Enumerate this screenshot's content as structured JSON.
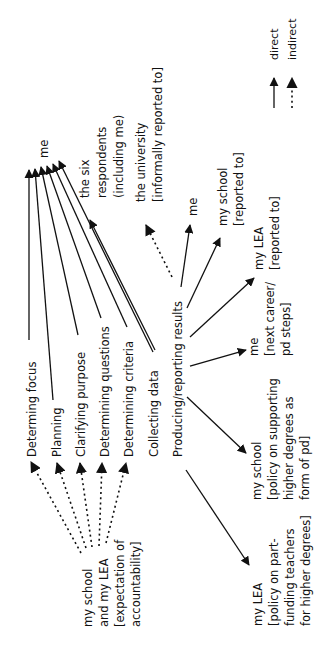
{
  "legend": {
    "direct": "direct",
    "indirect": "indirect"
  },
  "source": {
    "lines": [
      "my school",
      "and my LEA",
      "[expectation of",
      "accountability]"
    ]
  },
  "stages": [
    {
      "label": "Determing focus"
    },
    {
      "label": "Planning"
    },
    {
      "label": "Clarifying purpose"
    },
    {
      "label": "Determining questions"
    },
    {
      "label": "Determining criteria"
    },
    {
      "label": "Collecting data"
    },
    {
      "label": "Producing/reporting results"
    }
  ],
  "targets": {
    "me_top": {
      "lines": [
        "me"
      ]
    },
    "six_respondents": {
      "lines": [
        "the six",
        "respondents",
        "(including me)"
      ]
    },
    "university": {
      "lines": [
        "the university",
        "[informally reported to]"
      ]
    },
    "me_report": {
      "lines": [
        "me"
      ]
    },
    "my_school_report": {
      "lines": [
        "my school",
        "[reported to]"
      ]
    },
    "my_lea_report": {
      "lines": [
        "my LEA",
        "[reported to]"
      ]
    },
    "me_career": {
      "lines": [
        "me",
        "[next career/",
        "pd steps]"
      ]
    },
    "my_school_policy": {
      "lines": [
        "my school",
        "[policy on supporting",
        "higher degrees as",
        "form of pd]"
      ]
    },
    "my_lea_policy": {
      "lines": [
        "my LEA",
        "[policy on part-",
        "funding teachers",
        "for higher degrees]"
      ]
    }
  }
}
